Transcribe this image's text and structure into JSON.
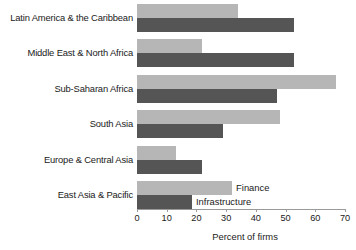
{
  "chart_data": {
    "type": "bar",
    "orientation": "horizontal",
    "title": "",
    "xlabel": "Percent of firms",
    "ylabel": "",
    "xlim": [
      0,
      70
    ],
    "xticks": [
      0,
      10,
      20,
      30,
      40,
      50,
      60,
      70
    ],
    "grid": false,
    "legend_position": "inline-right-of-last-group",
    "categories": [
      "Latin America & the Caribbean",
      "Middle East & North Africa",
      "Sub-Saharan Africa",
      "South Asia",
      "Europe & Central Asia",
      "East Asia & Pacific"
    ],
    "series": [
      {
        "name": "Finance",
        "color": "#b6b6b6",
        "values": [
          34,
          22,
          67,
          48,
          13,
          32
        ]
      },
      {
        "name": "Infrastructure",
        "color": "#555555",
        "values": [
          53,
          53,
          47,
          29,
          22,
          18.5
        ]
      }
    ]
  },
  "axis": {
    "tick_labels": [
      "0",
      "10",
      "20",
      "30",
      "40",
      "50",
      "60",
      "70"
    ],
    "x_title": "Percent of firms"
  },
  "legend": {
    "finance_label": "Finance",
    "infrastructure_label": "Infrastructure"
  },
  "colors": {
    "finance": "#b6b6b6",
    "infrastructure": "#555555",
    "axis": "#9a9a9a",
    "text": "#1a1a1a",
    "background": "#ffffff"
  }
}
